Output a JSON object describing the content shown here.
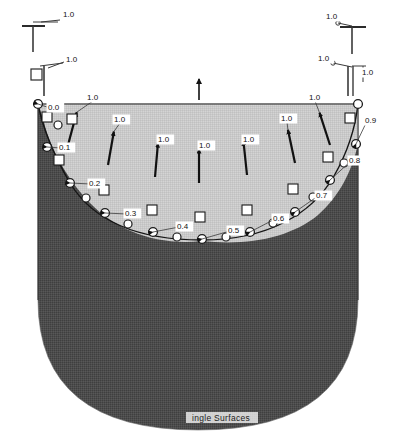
{
  "figure": {
    "caption": "Single Surfaces",
    "caption_visible_text": "ingle Surfaces",
    "colors": {
      "background": "#ffffff",
      "fluid_region_fill": "#4c4c4c",
      "free_region_fill": "#c9c9c9",
      "outline": "#ffffff",
      "marker_stroke": "#1a1a1a",
      "label_text": "#111111",
      "vector_color": "#111111"
    }
  },
  "boundary_condition_symbols": [
    {
      "id": "bc-top-left-upper",
      "type": "support-symbol",
      "glyph": "T-shape",
      "label": "1.0",
      "label_x": 63,
      "label_y": 17,
      "x": 31,
      "y": 23
    },
    {
      "id": "bc-top-right-upper",
      "type": "support-symbol",
      "glyph": "T-shape",
      "label": "1.0",
      "label_x": 326,
      "label_y": 19,
      "x": 350,
      "y": 24
    },
    {
      "id": "bc-top-left-lower",
      "type": "support-symbol-with-square",
      "glyph": "square-and-stem",
      "label": "1.0",
      "label_x": 66,
      "label_y": 62,
      "x": 38,
      "y": 73
    },
    {
      "id": "bc-top-right-lower",
      "type": "support-symbol-with-square",
      "glyph": "square-and-stem",
      "label": "1.0",
      "label_x": 318,
      "label_y": 61,
      "x": 350,
      "y": 72
    },
    {
      "id": "bc-top-right-vertical",
      "type": "support-symbol",
      "glyph": "vertical-stem",
      "label": "1.0",
      "label_x": 362,
      "label_y": 75,
      "x": 357,
      "y": 86
    }
  ],
  "center_arrow": {
    "id": "center-up-arrow",
    "x": 199,
    "y_tail": 100,
    "y_head": 76,
    "direction": "up",
    "label": ""
  },
  "velocity_vectors": [
    {
      "id": "v1",
      "x": 68,
      "y": 145,
      "label": "1.0",
      "label_x": 87,
      "label_y": 100,
      "angle_deg": -75
    },
    {
      "id": "v2",
      "x": 108,
      "y": 165,
      "label": "1.0",
      "label_x": 114,
      "label_y": 122,
      "angle_deg": -80
    },
    {
      "id": "v3",
      "x": 155,
      "y": 177,
      "label": "1.0",
      "label_x": 158,
      "label_y": 142,
      "angle_deg": -85
    },
    {
      "id": "v4",
      "x": 199,
      "y": 183,
      "label": "1.0",
      "label_x": 199,
      "label_y": 148,
      "angle_deg": -90
    },
    {
      "id": "v5",
      "x": 247,
      "y": 175,
      "label": "1.0",
      "label_x": 243,
      "label_y": 142,
      "angle_deg": -96
    },
    {
      "id": "v6",
      "x": 295,
      "y": 163,
      "label": "1.0",
      "label_x": 281,
      "label_y": 121,
      "angle_deg": -102
    },
    {
      "id": "v7",
      "x": 330,
      "y": 145,
      "label": "1.0",
      "label_x": 309,
      "label_y": 100,
      "angle_deg": -108
    }
  ],
  "interface_nodes": [
    {
      "id": "n0",
      "label": "0.0",
      "node_x": 38,
      "node_y": 104,
      "label_x": 48,
      "label_y": 110
    },
    {
      "id": "n1",
      "label": "0.1",
      "node_x": 47,
      "node_y": 147,
      "label_x": 59,
      "label_y": 150
    },
    {
      "id": "n2",
      "label": "0.2",
      "node_x": 70,
      "node_y": 183,
      "label_x": 89,
      "label_y": 186
    },
    {
      "id": "n3",
      "label": "0.3",
      "node_x": 105,
      "node_y": 213,
      "label_x": 125,
      "label_y": 216
    },
    {
      "id": "n4",
      "label": "0.4",
      "node_x": 153,
      "node_y": 232,
      "label_x": 177,
      "label_y": 229
    },
    {
      "id": "n5",
      "label": "0.5",
      "node_x": 202,
      "node_y": 239,
      "label_x": 228,
      "label_y": 233
    },
    {
      "id": "n6",
      "label": "0.6",
      "node_x": 250,
      "node_y": 232,
      "label_x": 273,
      "label_y": 221
    },
    {
      "id": "n7",
      "label": "0.7",
      "node_x": 295,
      "node_y": 212,
      "label_x": 316,
      "label_y": 198
    },
    {
      "id": "n8",
      "label": "0.8",
      "node_x": 330,
      "node_y": 180,
      "label_x": 349,
      "label_y": 163
    },
    {
      "id": "n9",
      "label": "0.9",
      "node_x": 356,
      "node_y": 144,
      "label_x": 365,
      "label_y": 123
    },
    {
      "id": "n10",
      "label": "",
      "node_x": 358,
      "node_y": 104,
      "label_x": 0,
      "label_y": 0
    }
  ],
  "extra_nodes": [
    {
      "id": "ne1",
      "node_x": 58,
      "node_y": 125
    },
    {
      "id": "ne2",
      "node_x": 86,
      "node_y": 198
    },
    {
      "id": "ne3",
      "node_x": 128,
      "node_y": 224
    },
    {
      "id": "ne4",
      "node_x": 177,
      "node_y": 237
    },
    {
      "id": "ne5",
      "node_x": 226,
      "node_y": 237
    },
    {
      "id": "ne6",
      "node_x": 273,
      "node_y": 223
    },
    {
      "id": "ne7",
      "node_x": 313,
      "node_y": 197
    },
    {
      "id": "ne8",
      "node_x": 344,
      "node_y": 163
    }
  ],
  "square_markers": [
    {
      "id": "sq1",
      "x": 47,
      "y": 117
    },
    {
      "id": "sq2",
      "x": 59,
      "y": 160
    },
    {
      "id": "sq3",
      "x": 72,
      "y": 119
    },
    {
      "id": "sq4",
      "x": 104,
      "y": 190
    },
    {
      "id": "sq5",
      "x": 152,
      "y": 210
    },
    {
      "id": "sq6",
      "x": 200,
      "y": 217
    },
    {
      "id": "sq7",
      "x": 247,
      "y": 210
    },
    {
      "id": "sq8",
      "x": 293,
      "y": 189
    },
    {
      "id": "sq9",
      "x": 328,
      "y": 157
    },
    {
      "id": "sq10",
      "x": 350,
      "y": 118
    }
  ],
  "geometry": {
    "domain_top_y": 104,
    "domain_left_x": 38,
    "domain_right_x": 358,
    "domain_bottom_y": 424,
    "interface_type": "free-surface-curve",
    "fluid_region_label": "lower dark region",
    "free_region_label": "upper light region"
  }
}
